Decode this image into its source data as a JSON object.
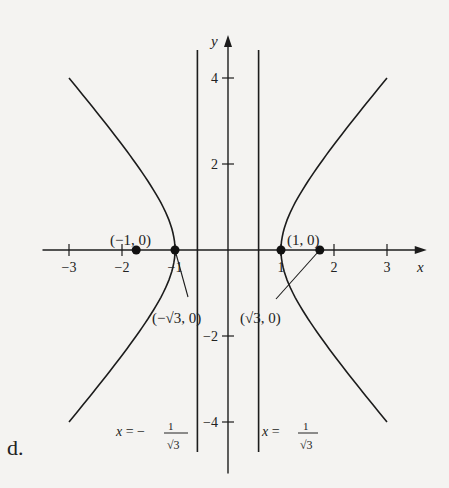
{
  "panel_label": "d.",
  "chart_data": {
    "type": "line",
    "title": "",
    "equation": "x^2 - y^2/2 = 1",
    "xlabel": "x",
    "ylabel": "y",
    "xlim": [
      -3.5,
      3.75
    ],
    "ylim": [
      -5.2,
      5.0
    ],
    "grid": false,
    "x_ticks": [
      {
        "value": -3,
        "label": "−3"
      },
      {
        "value": -2,
        "label": "−2"
      },
      {
        "value": -1,
        "label": "−1"
      },
      {
        "value": 1,
        "label": "1"
      },
      {
        "value": 2,
        "label": "2"
      },
      {
        "value": 3,
        "label": "3"
      }
    ],
    "y_ticks": [
      {
        "value": 4,
        "label": "4"
      },
      {
        "value": 2,
        "label": "2"
      },
      {
        "value": -2,
        "label": "−2"
      },
      {
        "value": -4,
        "label": "−4"
      }
    ],
    "series": [
      {
        "name": "right-branch",
        "a": 1,
        "b2": 2,
        "side": 1,
        "y_range": [
          -4,
          4
        ]
      },
      {
        "name": "left-branch",
        "a": 1,
        "b2": 2,
        "side": -1,
        "y_range": [
          -4,
          4
        ]
      }
    ],
    "vertical_lines": [
      {
        "name": "directrix-left",
        "x": -0.57735,
        "label_prefix": "x = −",
        "label_num": "1",
        "label_den": "√3"
      },
      {
        "name": "directrix-right",
        "x": 0.57735,
        "label_prefix": "x = ",
        "label_num": "1",
        "label_den": "√3"
      }
    ],
    "points": [
      {
        "name": "point-left-outer",
        "x": -1.732,
        "y": 0
      },
      {
        "name": "point-left-vertex",
        "x": -1,
        "y": 0
      },
      {
        "name": "point-right-vertex",
        "x": 1,
        "y": 0
      },
      {
        "name": "point-right-outer",
        "x": 1.732,
        "y": 0
      }
    ],
    "annotations": [
      {
        "name": "label-neg-one-zero",
        "text": "(−1, 0)"
      },
      {
        "name": "label-one-zero",
        "text": "(1, 0)"
      },
      {
        "name": "label-neg-sqrt3-zero",
        "text": "(−√3, 0)"
      },
      {
        "name": "label-sqrt3-zero",
        "text": "(√3, 0)"
      }
    ]
  }
}
